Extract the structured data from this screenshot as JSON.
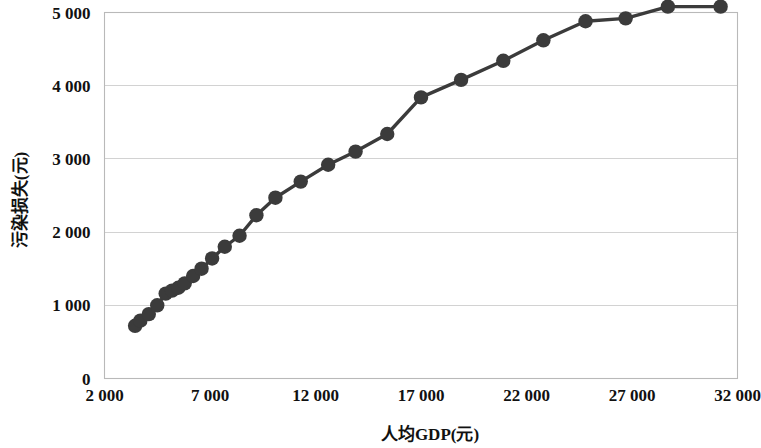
{
  "chart_data": {
    "type": "line",
    "title": "",
    "xlabel": "人均GDP(元)",
    "ylabel": "污染损失(元)",
    "xlim": [
      2000,
      32000
    ],
    "ylim": [
      0,
      5000
    ],
    "grid": true,
    "legend": false,
    "marker": "circle",
    "line_color": "#3b3b3b",
    "marker_color": "#3b3b3b",
    "grid_color": "#d2d2d2",
    "border_color": "#b9b9b9",
    "background": "#ffffff",
    "xticks": [
      2000,
      7000,
      12000,
      17000,
      22000,
      27000,
      32000
    ],
    "xtick_labels": [
      "2 000",
      "7 000",
      "12 000",
      "17 000",
      "22 000",
      "27 000",
      "32 000"
    ],
    "yticks": [
      0,
      1000,
      2000,
      3000,
      4000,
      5000
    ],
    "ytick_labels": [
      "0",
      "1 000",
      "2 000",
      "3 000",
      "4 000",
      "5 000"
    ],
    "series": [
      {
        "name": "污染损失",
        "x": [
          3450,
          3700,
          4100,
          4500,
          4900,
          5200,
          5500,
          5800,
          6200,
          6600,
          7100,
          7700,
          8400,
          9200,
          10100,
          11300,
          12600,
          13900,
          15400,
          17000,
          18900,
          20900,
          22800,
          24800,
          26700,
          28700,
          31200
        ],
        "y": [
          720,
          790,
          880,
          1000,
          1160,
          1200,
          1240,
          1300,
          1400,
          1500,
          1640,
          1800,
          1950,
          2230,
          2470,
          2690,
          2920,
          3100,
          3340,
          3840,
          4080,
          4340,
          4620,
          4880,
          4920,
          5080,
          5080
        ]
      }
    ]
  }
}
